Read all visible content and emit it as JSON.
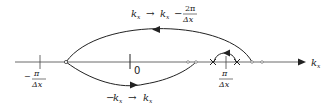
{
  "diagram": {
    "axis": {
      "label_main": "k",
      "label_sub": "x",
      "colors": {
        "stroke": "#222222",
        "background": "#ffffff"
      }
    },
    "ticks": {
      "neg_pi": {
        "sign": "−",
        "numerator": "π",
        "denominator": "Δx"
      },
      "zero": {
        "label": "0"
      },
      "pos_pi": {
        "numerator": "π",
        "denominator": "Δx"
      }
    },
    "top_arc_label": {
      "lhs_main": "k",
      "lhs_sub": "x",
      "arrow": "→",
      "rhs_main": "k",
      "rhs_sub": "x",
      "minus": "−",
      "numerator": "2π",
      "denominator": "Δx"
    },
    "bottom_arc_label": {
      "lhs_minus": "−",
      "lhs_main": "k",
      "lhs_sub": "x",
      "arrow": "→",
      "rhs_main": "k",
      "rhs_sub": "x"
    }
  }
}
